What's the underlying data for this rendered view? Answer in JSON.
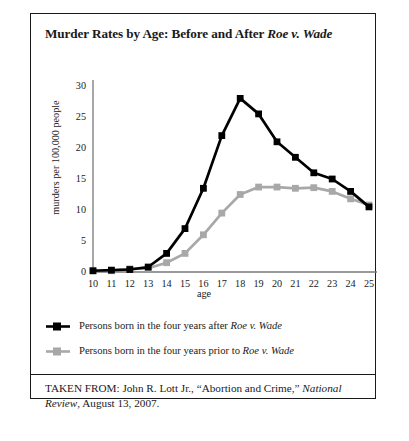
{
  "figure": {
    "title_prefix": "Murder Rates by Age: Before and After ",
    "title_italic": "Roe v. Wade"
  },
  "chart_data": {
    "type": "line",
    "title": "Murder Rates by Age: Before and After Roe v. Wade",
    "xlabel": "age",
    "ylabel": "murders per 100,000 people",
    "x": [
      10,
      11,
      12,
      13,
      14,
      15,
      16,
      17,
      18,
      19,
      20,
      21,
      22,
      23,
      24,
      25
    ],
    "xticklabels": [
      "10",
      "11",
      "12",
      "13",
      "14",
      "15",
      "16",
      "17",
      "18",
      "19",
      "20",
      "21",
      "22",
      "23",
      "24",
      "25"
    ],
    "yticks": [
      0,
      5,
      10,
      15,
      20,
      25,
      30
    ],
    "yticklabels": [
      "0",
      "5",
      "10",
      "15",
      "20",
      "25",
      "30"
    ],
    "xlim": [
      10,
      25
    ],
    "ylim": [
      0,
      30
    ],
    "grid": false,
    "legend_position": "below-plot",
    "series": [
      {
        "name": "Persons born in the four years after Roe v. Wade",
        "color": "#000000",
        "marker": "square",
        "values": [
          0.2,
          0.3,
          0.4,
          0.8,
          3.0,
          7.0,
          13.5,
          22.0,
          28.0,
          25.5,
          21.0,
          18.5,
          16.0,
          15.0,
          13.0,
          10.5
        ]
      },
      {
        "name": "Persons born in the four years prior to Roe v. Wade",
        "color": "#a8a8a8",
        "marker": "square",
        "values": [
          0.2,
          0.2,
          0.5,
          0.6,
          1.5,
          3.0,
          6.0,
          9.5,
          12.5,
          13.7,
          13.7,
          13.5,
          13.6,
          13.0,
          11.8,
          10.8
        ]
      }
    ]
  },
  "legend": [
    {
      "key_color": "#000000",
      "text_prefix": "Persons born in the four years after ",
      "text_italic": "Roe v. Wade",
      "text_suffix": ""
    },
    {
      "key_color": "#a8a8a8",
      "text_prefix": "Persons born in the four years prior to ",
      "text_italic": "Roe v. Wade",
      "text_suffix": ""
    }
  ],
  "source": {
    "prefix": "TAKEN FROM: John R. Lott Jr., “Abortion and Crime,” ",
    "italic": "National Review",
    "suffix": ", August 13, 2007."
  }
}
